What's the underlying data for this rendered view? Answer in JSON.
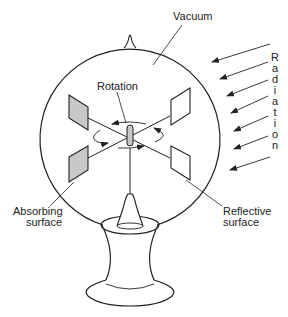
{
  "labels": {
    "vacuum": "Vacuum",
    "rotation": "Rotation",
    "absorbing_line1": "Absorbing",
    "absorbing_line2": "surface",
    "reflective_line1": "Reflective",
    "reflective_line2": "surface",
    "radiation_letters": [
      "R",
      "a",
      "d",
      "i",
      "a",
      "t",
      "i",
      "o",
      "n"
    ]
  },
  "colors": {
    "line": "#222222",
    "absorbing_fill": "#c8c8c8",
    "reflective_fill": "#ffffff",
    "background": "#ffffff"
  }
}
